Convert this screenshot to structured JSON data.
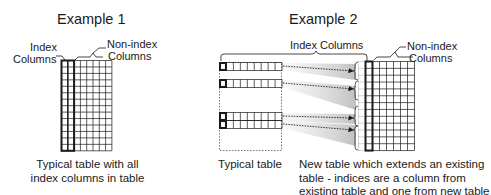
{
  "example1": {
    "title": "Example 1",
    "index_label_line1": "Index",
    "index_label_line2": "Columns",
    "nonindex_label_line1": "Non-index",
    "nonindex_label_line2": "Columns",
    "caption_line1": "Typical table with all",
    "caption_line2": "index columns in table",
    "grid": {
      "index_columns": 2,
      "nonindex_columns": 6,
      "rows": 14
    }
  },
  "example2": {
    "title": "Example 2",
    "index_label": "Index Columns",
    "nonindex_label_line1": "Non-index",
    "nonindex_label_line2": "Columns",
    "left_caption": "Typical table",
    "right_caption_line1": "New table which extends an existing",
    "right_caption_line2": "table - indices are a column from",
    "right_caption_line3": "existing table and one from new table",
    "left_table": {
      "selected_rows": 4,
      "cells_per_row": 9
    },
    "right_table": {
      "index_columns": 2,
      "nonindex_columns": 6,
      "rows": 13
    }
  },
  "colors": {
    "line": "#1a1a1a",
    "shade": "#c8c8c8",
    "dotted": "#555555"
  }
}
